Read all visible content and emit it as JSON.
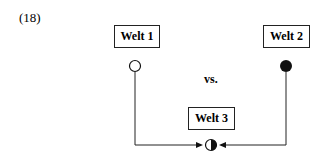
{
  "example_number": "(18)",
  "boxes": {
    "world1": "Welt 1",
    "world2": "Welt 2",
    "world3": "Welt 3"
  },
  "versus": "vs.",
  "symbols": {
    "world1": "open-circle",
    "world2": "filled-circle",
    "world3": "half-filled-circle"
  }
}
